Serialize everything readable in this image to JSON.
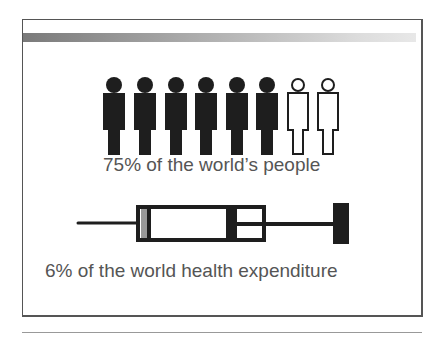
{
  "slide": {
    "people": {
      "total": 8,
      "filled": 6,
      "filled_color": "#1e1e1e",
      "outline_color": "#1e1e1e"
    },
    "caption_people": "75% of the world’s people",
    "syringe_icon": "syringe-icon",
    "caption_expenditure": "6% of the world health expenditure"
  }
}
